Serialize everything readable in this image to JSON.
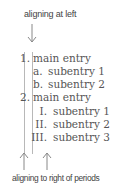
{
  "annotations": {
    "top_label": "aligning at left",
    "bottom_label": "aligning to right of periods"
  },
  "list": [
    {
      "marker": "1.",
      "text": "main entry",
      "level": 0
    },
    {
      "marker": "a.",
      "text": "subentry 1",
      "level": 1
    },
    {
      "marker": "b.",
      "text": "subentry 2",
      "level": 1
    },
    {
      "marker": "2.",
      "text": "main entry",
      "level": 0
    },
    {
      "marker": "I.",
      "text": "subentry 1",
      "level": 2
    },
    {
      "marker": "II.",
      "text": "subentry 2",
      "level": 2
    },
    {
      "marker": "III.",
      "text": "subentry 3",
      "level": 2
    }
  ],
  "colors": {
    "text": "#555555",
    "guide_lines": "#b8b8b8",
    "background": "#ffffff"
  }
}
